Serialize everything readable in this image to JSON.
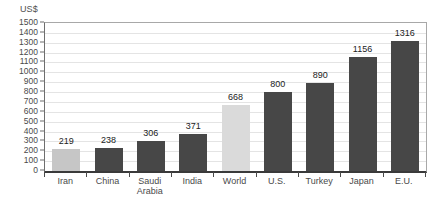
{
  "chart_data": {
    "type": "bar",
    "title": "",
    "ylabel": "US$",
    "xlabel": "",
    "categories": [
      "Iran",
      "China",
      "Saudi Arabia",
      "India",
      "World",
      "U.S.",
      "Turkey",
      "Japan",
      "E.U."
    ],
    "values": [
      219,
      238,
      306,
      371,
      668,
      800,
      890,
      1156,
      1316
    ],
    "value_labels": [
      "219",
      "238",
      "306",
      "371",
      "668",
      "800",
      "890",
      "1156",
      "1316"
    ],
    "highlighted_categories": [
      "Iran",
      "World"
    ],
    "bar_colors": [
      "#c6c6c6",
      "#474747",
      "#474747",
      "#474747",
      "#dadada",
      "#474747",
      "#474747",
      "#474747",
      "#474747"
    ],
    "ylim": [
      0,
      1500
    ],
    "ytick_step": 100,
    "yticks": [
      0,
      100,
      200,
      300,
      400,
      500,
      600,
      700,
      800,
      900,
      1000,
      1100,
      1200,
      1300,
      1400,
      1500
    ],
    "grid": true,
    "legend": "none",
    "show_value_labels": true
  },
  "colors": {
    "bar_dark": "#474747",
    "bar_light": "#c6c6c6",
    "gridline": "#e4e4e4",
    "axis_line": "#3a3a3a",
    "frame_line": "#a8a8a8",
    "value_text": "#222222",
    "axis_text": "#4a4a4a",
    "background": "#ffffff"
  }
}
